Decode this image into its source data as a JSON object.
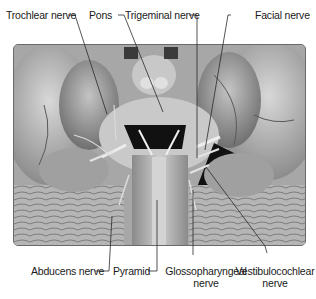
{
  "figure": {
    "type": "labeled anatomical photograph"
  },
  "labels": {
    "top": [
      {
        "id": "trochlear",
        "text": "Trochlear nerve"
      },
      {
        "id": "pons",
        "text": "Pons"
      },
      {
        "id": "trigeminal",
        "text": "Trigeminal nerve"
      },
      {
        "id": "facial",
        "text": "Facial nerve"
      }
    ],
    "bottom": [
      {
        "id": "abducens",
        "text": "Abducens nerve"
      },
      {
        "id": "pyramid",
        "text": "Pyramid"
      },
      {
        "id": "glossopharyngeal",
        "line1": "Glossopharyngeal",
        "line2": "nerve"
      },
      {
        "id": "vestibulocochlear",
        "line1": "Vestibulocochlear",
        "line2": "nerve"
      }
    ]
  },
  "colors": {
    "label_text": "#1a1a1a",
    "leader_line": "#2a2a2a",
    "background": "#ffffff"
  }
}
